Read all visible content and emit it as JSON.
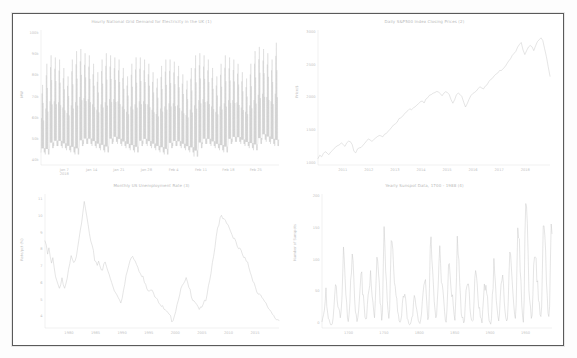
{
  "figure": {
    "background": "#ffffff",
    "border_color": "#5a5a5a",
    "line_color": "#c4c4c4",
    "text_color": "#c0c0c0",
    "layout": "2x2 grid of time-series line plots"
  },
  "chart_data": [
    {
      "type": "line",
      "id": 1,
      "position": "top-left",
      "title": "Hourly National Grid Demand for Electricity in the UK (1)",
      "xlabel": "",
      "ylabel": "MW",
      "grid": false,
      "legend": "none",
      "xticklabels": [
        "Jan 7\n2018",
        "Jan 14",
        "Jan 21",
        "Jan 28",
        "Feb 4",
        "Feb 11",
        "Feb 18",
        "Feb 25"
      ],
      "yticklabels": [
        "100k",
        "90k",
        "80k",
        "70k",
        "60k",
        "50k",
        "40k"
      ],
      "ylim": [
        38000,
        102000
      ],
      "yticks": [
        100000,
        90000,
        80000,
        70000,
        60000,
        50000,
        40000
      ],
      "xlim": [
        "2018-01-05",
        "2018-03-01"
      ],
      "description": "Dense hourly oscillation between roughly 42k and 96k MW with strong daily cycle",
      "series": [
        {
          "name": "Demand",
          "daily_min": [
            44000,
            43000,
            46000,
            47000,
            47000,
            46000,
            45000,
            44000,
            43000,
            47000,
            48000,
            48000,
            47000,
            46000,
            45000,
            44000,
            48000,
            49000,
            48000,
            47000,
            46000,
            45000,
            44000,
            47000,
            48000,
            47000,
            46000,
            45000,
            44000,
            43000,
            46000,
            47000,
            47000,
            46000,
            45000,
            44000,
            42000,
            46000,
            48000,
            48000,
            47000,
            46000,
            45000,
            44000,
            48000,
            49000,
            49000,
            48000,
            47000,
            46000,
            45000,
            48000,
            50000,
            49000,
            48000,
            47000
          ],
          "daily_max": [
            76000,
            86000,
            90000,
            89000,
            88000,
            84000,
            80000,
            88000,
            92000,
            93000,
            91000,
            90000,
            86000,
            82000,
            88000,
            91000,
            90000,
            89000,
            88000,
            84000,
            80000,
            86000,
            89000,
            89000,
            88000,
            86000,
            82000,
            79000,
            85000,
            88000,
            88000,
            87000,
            85000,
            81000,
            78000,
            84000,
            90000,
            91000,
            90000,
            88000,
            84000,
            80000,
            86000,
            90000,
            89000,
            88000,
            86000,
            82000,
            79000,
            86000,
            92000,
            94000,
            93000,
            91000,
            88000,
            96000
          ]
        }
      ]
    },
    {
      "type": "line",
      "id": 2,
      "position": "top-right",
      "title": "Daily S&P500 Index Closing Prices (2)",
      "xlabel": "",
      "ylabel": "Price/$",
      "grid": false,
      "legend": "none",
      "xticklabels": [
        "2011",
        "2012",
        "2013",
        "2014",
        "2015",
        "2016",
        "2017",
        "2018"
      ],
      "yticklabels": [
        "3000",
        "2500",
        "2000",
        "1500",
        "1000"
      ],
      "ylim": [
        980,
        3050
      ],
      "yticks": [
        3000,
        2500,
        2000,
        1500,
        1000
      ],
      "description": "Upward trending index from about 1050 in 2010 to a peak near 2930 in 2018 with a sharp drop at the end",
      "series": [
        {
          "name": "S&P500 Close",
          "values": [
            1080,
            1120,
            1105,
            1150,
            1180,
            1160,
            1130,
            1175,
            1210,
            1240,
            1260,
            1280,
            1300,
            1320,
            1295,
            1260,
            1310,
            1340,
            1330,
            1290,
            1180,
            1160,
            1220,
            1250,
            1260,
            1290,
            1320,
            1360,
            1390,
            1370,
            1330,
            1360,
            1390,
            1410,
            1430,
            1420,
            1400,
            1440,
            1470,
            1500,
            1530,
            1560,
            1600,
            1620,
            1640,
            1680,
            1700,
            1720,
            1760,
            1790,
            1810,
            1840,
            1830,
            1860,
            1880,
            1900,
            1930,
            1960,
            1970,
            1940,
            1990,
            2010,
            2040,
            2060,
            2080,
            2090,
            2100,
            2110,
            2080,
            2050,
            2090,
            2110,
            2100,
            2070,
            1990,
            1920,
            1980,
            2050,
            2080,
            2060,
            2020,
            1940,
            1880,
            1930,
            2000,
            2050,
            2080,
            2100,
            2120,
            2150,
            2170,
            2160,
            2140,
            2180,
            2200,
            2250,
            2280,
            2320,
            2360,
            2380,
            2400,
            2430,
            2440,
            2470,
            2480,
            2520,
            2570,
            2600,
            2650,
            2680,
            2720,
            2780,
            2840,
            2870,
            2750,
            2680,
            2740,
            2790,
            2820,
            2780,
            2730,
            2800,
            2860,
            2900,
            2930,
            2880,
            2760,
            2650,
            2490,
            2350
          ]
        }
      ]
    },
    {
      "type": "line",
      "id": 3,
      "position": "bottom-left",
      "title": "Monthly US Unemployment Rate (3)",
      "xlabel": "",
      "ylabel": "Rate/pct (%)",
      "grid": false,
      "legend": "none",
      "xticklabels": [
        "1980",
        "1985",
        "1990",
        "1995",
        "2000",
        "2005",
        "2010",
        "2015"
      ],
      "yticklabels": [
        "11",
        "10",
        "9",
        "8",
        "7",
        "6",
        "5",
        "4"
      ],
      "ylim": [
        3.4,
        11.4
      ],
      "yticks": [
        11,
        10,
        9,
        8,
        7,
        6,
        5,
        4
      ],
      "description": "Unemployment rate peaking near 10.8 in 1982 and near 10.0 in 2009, troughs near 3.8 in 2000 and 2018",
      "series": [
        {
          "name": "Unemployment Rate",
          "values": [
            8.6,
            8.2,
            7.8,
            8.1,
            7.6,
            7.2,
            7.5,
            7.0,
            6.6,
            6.3,
            6.0,
            5.8,
            6.1,
            6.4,
            6.0,
            5.7,
            5.9,
            6.3,
            6.8,
            7.2,
            7.6,
            7.4,
            7.2,
            7.5,
            7.8,
            8.3,
            8.8,
            9.4,
            9.8,
            10.4,
            10.8,
            10.4,
            10.0,
            9.5,
            9.0,
            8.5,
            8.2,
            7.9,
            7.5,
            7.4,
            7.2,
            7.4,
            7.2,
            7.0,
            6.9,
            7.1,
            7.3,
            7.0,
            6.8,
            6.6,
            6.3,
            6.1,
            5.9,
            5.7,
            5.6,
            5.4,
            5.3,
            5.2,
            5.0,
            5.3,
            5.6,
            6.0,
            6.4,
            6.8,
            7.1,
            7.4,
            7.5,
            7.8,
            7.6,
            7.5,
            7.3,
            7.1,
            6.9,
            6.8,
            6.6,
            6.4,
            6.1,
            5.9,
            5.7,
            5.6,
            5.5,
            5.6,
            5.8,
            5.6,
            5.4,
            5.3,
            5.2,
            5.0,
            4.9,
            4.7,
            4.6,
            4.5,
            4.4,
            4.3,
            4.2,
            4.1,
            4.0,
            3.9,
            4.0,
            4.2,
            4.5,
            4.8,
            5.2,
            5.5,
            5.7,
            5.8,
            6.0,
            6.1,
            6.3,
            6.0,
            5.8,
            5.6,
            5.4,
            5.2,
            5.1,
            5.0,
            4.9,
            4.7,
            4.6,
            4.5,
            4.6,
            4.7,
            4.9,
            5.0,
            5.4,
            5.8,
            6.2,
            6.8,
            7.3,
            7.8,
            8.3,
            8.9,
            9.4,
            9.7,
            9.9,
            10.0,
            9.9,
            9.8,
            9.7,
            9.6,
            9.5,
            9.4,
            9.2,
            9.0,
            8.9,
            8.8,
            8.6,
            8.3,
            8.2,
            8.1,
            7.9,
            7.8,
            7.6,
            7.5,
            7.3,
            7.2,
            7.0,
            6.8,
            6.6,
            6.3,
            6.1,
            5.9,
            5.7,
            5.5,
            5.4,
            5.3,
            5.1,
            5.0,
            4.9,
            4.8,
            4.7,
            4.6,
            4.5,
            4.4,
            4.3,
            4.2,
            4.1,
            4.0,
            3.9,
            3.8
          ]
        }
      ]
    },
    {
      "type": "line",
      "id": 4,
      "position": "bottom-right",
      "title": "Yearly Sunspot Data, 1700 - 1988 (4)",
      "xlabel": "",
      "ylabel": "Number of Sunspots",
      "grid": false,
      "legend": "none",
      "xticklabels": [
        "1700",
        "1750",
        "1800",
        "1850",
        "1900",
        "1950"
      ],
      "yticklabels": [
        "200",
        "150",
        "100",
        "50",
        "0"
      ],
      "ylim": [
        -5,
        205
      ],
      "yticks": [
        200,
        150,
        100,
        50,
        0
      ],
      "xlim": [
        1700,
        1988
      ],
      "description": "Roughly 11-year solar cycle, yearly mean sunspot number from 1700 to 1988, maximum near 190 around 1957",
      "series": [
        {
          "name": "Sunspots",
          "values": [
            5,
            11,
            16,
            23,
            36,
            58,
            29,
            20,
            10,
            8,
            3,
            0,
            0,
            2,
            11,
            27,
            47,
            63,
            60,
            39,
            28,
            26,
            22,
            11,
            21,
            40,
            78,
            122,
            103,
            73,
            47,
            35,
            11,
            5,
            16,
            34,
            70,
            81,
            111,
            101,
            73,
            40,
            20,
            16,
            5,
            11,
            22,
            40,
            60,
            80,
            83,
            47,
            47,
            30,
            12,
            9,
            10,
            32,
            47,
            54,
            62,
            85,
            61,
            45,
            36,
            21,
            11,
            38,
            70,
            106,
            100,
            81,
            66,
            34,
            30,
            7,
            19,
            92,
            154,
            125,
            84,
            68,
            38,
            22,
            10,
            24,
            82,
            132,
            130,
            118,
            89,
            66,
            60,
            46,
            41,
            21,
            16,
            6,
            4,
            7,
            14,
            34,
            45,
            43,
            48,
            42,
            28,
            10,
            8,
            2,
            0,
            1,
            5,
            12,
            14,
            35,
            46,
            41,
            30,
            24,
            16,
            7,
            4,
            2,
            8,
            17,
            36,
            50,
            62,
            67,
            71,
            48,
            28,
            8,
            13,
            57,
            122,
            138,
            103,
            86,
            63,
            37,
            24,
            11,
            15,
            40,
            62,
            98,
            124,
            96,
            66,
            64,
            54,
            39,
            21,
            7,
            4,
            23,
            55,
            94,
            96,
            77,
            59,
            44,
            47,
            30,
            16,
            7,
            37,
            74,
            139,
            111,
            102,
            66,
            45,
            17,
            11,
            12,
            3,
            6,
            32,
            54,
            60,
            64,
            64,
            52,
            25,
            13,
            7,
            6,
            7,
            36,
            73,
            85,
            78,
            64,
            42,
            26,
            27,
            12,
            10,
            3,
            24,
            42,
            64,
            54,
            62,
            49,
            44,
            19,
            6,
            4,
            1,
            10,
            47,
            57,
            104,
            81,
            64,
            38,
            26,
            14,
            6,
            17,
            44,
            64,
            69,
            78,
            65,
            36,
            21,
            11,
            6,
            9,
            36,
            80,
            114,
            110,
            89,
            68,
            48,
            31,
            16,
            10,
            33,
            93,
            152,
            136,
            135,
            84,
            69,
            32,
            14,
            4,
            38,
            142,
            190,
            185,
            159,
            112,
            54,
            38,
            28,
            10,
            15,
            47,
            94,
            106,
            106,
            105,
            67,
            69,
            38,
            35,
            16,
            13,
            28,
            92,
            155,
            155,
            140,
            116,
            67,
            46,
            18,
            13,
            29,
            100,
            158,
            143
          ]
        }
      ]
    }
  ]
}
